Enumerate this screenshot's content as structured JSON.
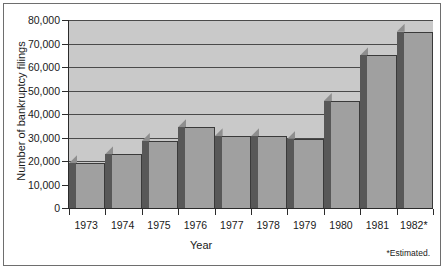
{
  "chart_data": {
    "type": "bar",
    "title": "",
    "xlabel": "Year",
    "ylabel": "Number of bankruptcy filings",
    "categories": [
      "1973",
      "1974",
      "1975",
      "1976",
      "1977",
      "1978",
      "1979",
      "1980",
      "1981",
      "1982*"
    ],
    "values": [
      19000,
      23000,
      28500,
      34500,
      30500,
      30500,
      29500,
      45500,
      65000,
      75000
    ],
    "ylim": [
      0,
      80000
    ],
    "ytick_labels": [
      "80,000",
      "70,000",
      "60,000",
      "50,000",
      "40,000",
      "30,000",
      "20,000",
      "10,000",
      "0"
    ],
    "ytick_values": [
      80000,
      70000,
      60000,
      50000,
      40000,
      30000,
      20000,
      10000,
      0
    ],
    "grid": true,
    "legend": "none",
    "footnote": "*Estimated.",
    "colors": {
      "plot_background": "#c9c9c9",
      "gridline": "#4a4a4a",
      "bar_face": "#a0a0a0",
      "bar_side": "#585858",
      "bar_top": "#8e8e8e",
      "axis": "#2b2b2b",
      "text": "#1a1a1a",
      "page_background": "#ffffff"
    }
  }
}
